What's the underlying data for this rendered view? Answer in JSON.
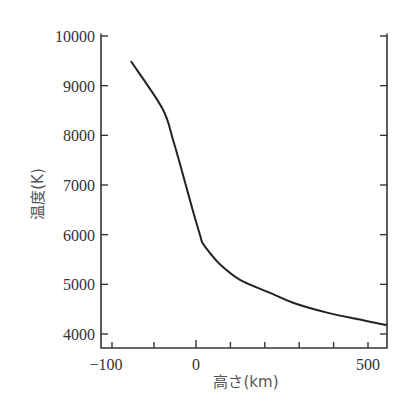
{
  "chart_data": {
    "type": "line",
    "title": "",
    "xlabel": "高さ(km)",
    "ylabel": "温度(K)",
    "xlim": [
      -115,
      555
    ],
    "ylim": [
      3750,
      10050
    ],
    "x_ticks": [
      -100,
      -50,
      0,
      100,
      200,
      300,
      400,
      500
    ],
    "x_tick_labels": [
      {
        "value": -100,
        "label": "−100"
      },
      {
        "value": 0,
        "label": "0"
      },
      {
        "value": 500,
        "label": "500"
      }
    ],
    "y_ticks": [
      4000,
      5000,
      6000,
      7000,
      8000,
      9000,
      10000
    ],
    "y_tick_labels": [
      "4000",
      "5000",
      "6000",
      "7000",
      "8000",
      "9000",
      "10000"
    ],
    "x_scale_note": "piecewise: negative side expanded (about 84px per 100 km) vs positive side (about 34px per 100 km)",
    "grid": false,
    "frame": "left, bottom and right axes; right axis has tick marks without labels",
    "legend": null,
    "series": [
      {
        "name": "temperature",
        "x": [
          -77,
          -40,
          -27,
          -13,
          -4,
          13,
          20,
          42,
          70,
          128,
          215,
          282,
          381,
          477,
          552
        ],
        "y": [
          9480,
          8540,
          7890,
          7050,
          6500,
          5960,
          5820,
          5620,
          5400,
          5090,
          4830,
          4630,
          4430,
          4290,
          4180
        ]
      }
    ]
  }
}
